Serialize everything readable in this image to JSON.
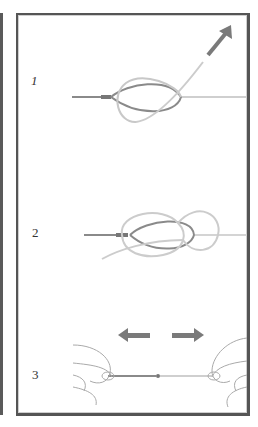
{
  "diagram": {
    "type": "knot-tying-instructions",
    "steps": [
      {
        "number": "1",
        "description": "Form loop and pass tag end through; pull tag end away",
        "arrow": "arrow-up-right"
      },
      {
        "number": "2",
        "description": "Wrap tag end around to form second loop",
        "arrow": null
      },
      {
        "number": "3",
        "description": "Pull both ends in opposite directions to tighten",
        "arrow": "arrows-left-right"
      }
    ],
    "colors": {
      "frame": "#555555",
      "main_line": "#8a8a8a",
      "tag_line": "#c8c8c8",
      "arrow": "#7a7a7a",
      "text": "#333333"
    }
  }
}
